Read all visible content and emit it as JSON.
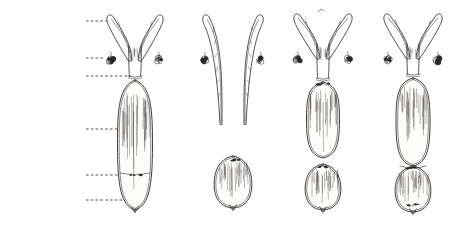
{
  "plate": {
    "background_color": "#ffffff",
    "ink_color": "#2b2724",
    "title_present": false
  },
  "labels": [
    {
      "id": "horns-of-uterus",
      "text": "Horns of Uterus",
      "x": 8,
      "y": 17,
      "leader": {
        "x1": 86,
        "y1": 21,
        "x2": 107,
        "y2": 21
      }
    },
    {
      "id": "ovary",
      "text": "Ovary",
      "x": 8,
      "y": 54,
      "leader": {
        "x1": 86,
        "y1": 58,
        "x2": 104,
        "y2": 58
      }
    },
    {
      "id": "neck-of-uterus",
      "text": "Neck of Uterus,",
      "x": 8,
      "y": 70,
      "leader": {
        "x1": 86,
        "y1": 76,
        "x2": 131,
        "y2": 76
      }
    },
    {
      "id": "vagina",
      "text": "Vagina",
      "x": 8,
      "y": 125,
      "leader": {
        "x1": 86,
        "y1": 129,
        "x2": 136,
        "y2": 129
      }
    },
    {
      "id": "opening-of-urethra",
      "text": "Opening of\nUrethra",
      "x": 8,
      "y": 171,
      "leader": {
        "x1": 86,
        "y1": 175,
        "x2": 133,
        "y2": 175
      }
    },
    {
      "id": "vulva",
      "text": "Vulva",
      "x": 8,
      "y": 198,
      "leader": {
        "x1": 86,
        "y1": 200,
        "x2": 133,
        "y2": 200
      }
    }
  ],
  "figures": [
    {
      "id": "figure-a",
      "caption": "a.",
      "caption_x": 130,
      "caption_y": 228,
      "center_x": 135,
      "description": "complete tract, horns joined, single long continuous vagina-vulva body"
    },
    {
      "id": "figure-b",
      "caption": "b.",
      "caption_x": 231,
      "caption_y": 228,
      "center_x": 233,
      "description": "separated long slender horns, detached pear-shaped vulva below"
    },
    {
      "id": "figure-c",
      "caption": "c.",
      "caption_x": 321,
      "caption_y": 228,
      "center_x": 323,
      "description": "horns joined, narrow oval vagina, separate rounded vulva"
    },
    {
      "id": "figure-d",
      "caption": "d.",
      "caption_x": 412,
      "caption_y": 228,
      "center_x": 413,
      "description": "horns joined, oval vagina fused to rounded vulva"
    }
  ]
}
